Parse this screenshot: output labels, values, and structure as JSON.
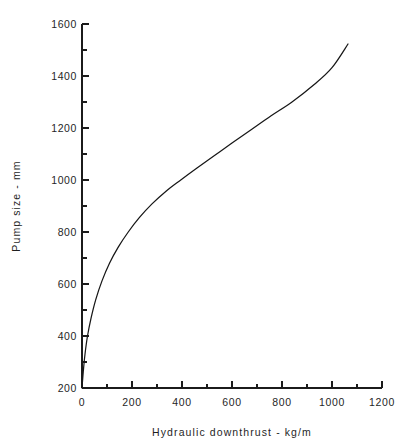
{
  "chart_data": {
    "type": "line",
    "title": "",
    "xlabel": "Hydraulic downthrust -  kg/m",
    "ylabel": "Pump size  -  mm",
    "xlim": [
      0,
      1200
    ],
    "ylim": [
      200,
      1600
    ],
    "grid": false,
    "legend": null,
    "x_ticks": [
      0,
      200,
      400,
      600,
      800,
      1000,
      1200
    ],
    "x_tick_labels": [
      "0",
      "200",
      "400",
      "600",
      "800",
      "1000",
      "1200"
    ],
    "x_minor_ticks": [
      100,
      300,
      500,
      700,
      900,
      1100
    ],
    "y_ticks": [
      200,
      400,
      600,
      800,
      1000,
      1200,
      1400,
      1600
    ],
    "y_tick_labels": [
      "200",
      "400",
      "600",
      "800",
      "1000",
      "1200",
      "1400",
      "1600"
    ],
    "y_minor_ticks": [
      300,
      500,
      700,
      900,
      1100,
      1300,
      1500
    ],
    "series": [
      {
        "name": "Pump size vs hydraulic downthrust",
        "color": "#171717",
        "x": [
          0,
          5,
          12,
          22,
          36,
          55,
          80,
          110,
          145,
          185,
          230,
          280,
          335,
          395,
          460,
          530,
          600,
          675,
          755,
          840,
          930,
          1000,
          1064
        ],
        "y": [
          200,
          262,
          330,
          400,
          468,
          540,
          612,
          680,
          742,
          800,
          856,
          908,
          956,
          1000,
          1046,
          1094,
          1142,
          1192,
          1246,
          1300,
          1368,
          1432,
          1523
        ]
      }
    ]
  },
  "axes": {
    "x_axis_name": "x-axis",
    "y_axis_name": "y-axis"
  }
}
